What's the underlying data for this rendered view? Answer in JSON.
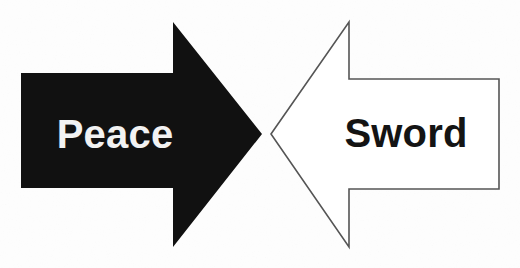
{
  "figure": {
    "background_color": "#fdfdfd",
    "width": 520,
    "height": 268,
    "left_arrow": {
      "label": "Peace",
      "direction": "right",
      "fill_color": "#111111",
      "stroke_color": "none",
      "label_color": "#f2f2f2",
      "points": "21,73 173,73 173,22 262,134 173,247 173,188 21,188"
    },
    "right_arrow": {
      "label": "Sword",
      "direction": "left",
      "fill_color": "#ffffff",
      "stroke_color": "#555555",
      "label_color": "#141414",
      "points": "271,134 349,22 349,79 499,79 499,189 349,189 349,247"
    }
  }
}
